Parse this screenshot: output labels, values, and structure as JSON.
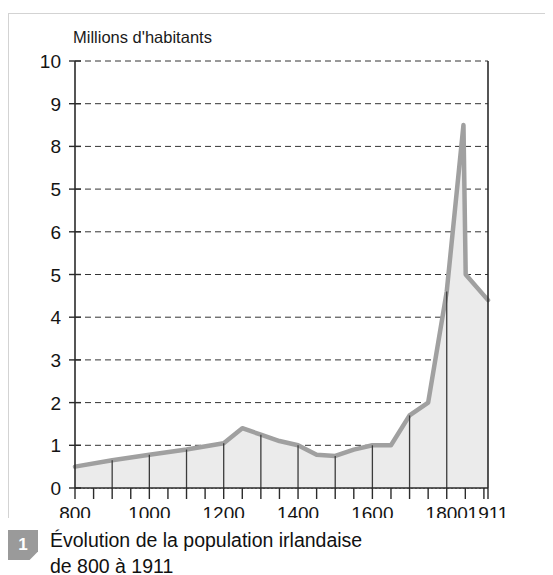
{
  "figure": {
    "badge_label": "1",
    "caption_line1": "Évolution de la population irlandaise",
    "caption_line2": "de 800 à 1911"
  },
  "colors": {
    "area_fill": "#ebebeb",
    "line": "#a0a0a0",
    "gridline": "#333333",
    "axis": "#2b2b2b",
    "droplines": "#3c3c3c",
    "badge_bg": "#9a9a9a",
    "card_border": "#d3d3d3",
    "text": "#141414"
  },
  "chart_data": {
    "type": "area",
    "title": "",
    "ylabel": "Millions d'habitants",
    "xlabel": "",
    "xlim": [
      800,
      1911
    ],
    "ylim": [
      0,
      10
    ],
    "grid": true,
    "legend": "none",
    "ytick_labels": [
      "10",
      "9",
      "8",
      "5",
      "6",
      "5",
      "4",
      "3",
      "2",
      "1",
      "0"
    ],
    "ytick_values": [
      10,
      9,
      8,
      7,
      6,
      5,
      4,
      3,
      2,
      1,
      0
    ],
    "xtick_labels": [
      "800",
      "1000",
      "1200",
      "1400",
      "1600",
      "1800",
      "1911"
    ],
    "xtick_values": [
      800,
      1000,
      1200,
      1400,
      1600,
      1800,
      1911
    ],
    "xminor_step": 50,
    "x": [
      800,
      900,
      1000,
      1100,
      1200,
      1250,
      1300,
      1350,
      1400,
      1450,
      1500,
      1550,
      1600,
      1650,
      1700,
      1750,
      1800,
      1845,
      1851,
      1911
    ],
    "values": [
      0.5,
      0.65,
      0.78,
      0.9,
      1.05,
      1.4,
      1.25,
      1.1,
      1.0,
      0.78,
      0.75,
      0.9,
      1.0,
      1.0,
      1.7,
      2.0,
      4.6,
      8.5,
      5.0,
      4.4
    ],
    "droplines_at": [
      900,
      1000,
      1100,
      1200,
      1300,
      1400,
      1500,
      1600,
      1700,
      1800
    ]
  }
}
